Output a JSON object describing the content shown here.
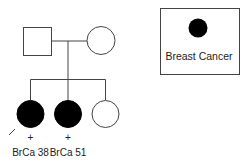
{
  "diagram": {
    "type": "pedigree",
    "colors": {
      "line": "#444444",
      "affected_fill": "#000000",
      "unaffected_fill": "#ffffff"
    },
    "generation_1": [
      {
        "id": "father",
        "shape": "square",
        "affected": false
      },
      {
        "id": "mother",
        "shape": "circle",
        "affected": false
      }
    ],
    "generation_2": [
      {
        "id": "daughter-1",
        "shape": "circle",
        "affected": true,
        "proband": true,
        "marker": "+",
        "label": "BrCa 38"
      },
      {
        "id": "daughter-2",
        "shape": "circle",
        "affected": true,
        "proband": false,
        "marker": "+",
        "label": "BrCa 51"
      },
      {
        "id": "daughter-3",
        "shape": "circle",
        "affected": false,
        "proband": false
      }
    ],
    "legend": {
      "symbol": "filled-circle",
      "label": "Breast Cancer"
    }
  }
}
